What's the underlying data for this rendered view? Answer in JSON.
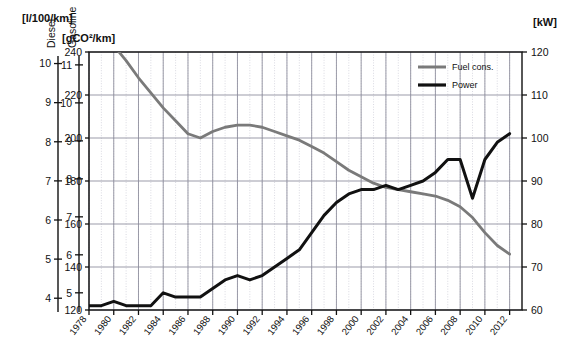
{
  "axes": {
    "top_left_unit": "[l/100/km]",
    "diesel_label": "Diesel",
    "gasoline_label": "Gasoline",
    "co2_unit": "[gCO²/km]",
    "kw_unit": "[kW]",
    "diesel_ticks": [
      "10",
      "9",
      "8",
      "7",
      "6",
      "5",
      "4"
    ],
    "gasoline_ticks": [
      "11",
      "10",
      "9",
      "8",
      "7",
      "6",
      "5"
    ],
    "co2_ticks": [
      "240",
      "220",
      "200",
      "180",
      "160",
      "140",
      "120"
    ],
    "kw_ticks": [
      "120",
      "110",
      "100",
      "90",
      "80",
      "70",
      "60"
    ],
    "x_ticks": [
      "1978",
      "1980",
      "1982",
      "1984",
      "1986",
      "1988",
      "1990",
      "1992",
      "1994",
      "1996",
      "1998",
      "2000",
      "2002",
      "2004",
      "2006",
      "2008",
      "2010",
      "2012"
    ]
  },
  "legend": {
    "items": [
      {
        "label": "Fuel cons.",
        "color": "#7a7a7a"
      },
      {
        "label": "Power",
        "color": "#111111"
      }
    ]
  },
  "colors": {
    "fuel": "#7a7a7a",
    "power": "#111111",
    "grid_major": "#8a8a99",
    "grid_minor": "#c9c9d4",
    "axis": "#111111"
  },
  "chart_data": {
    "type": "line",
    "title": "",
    "subtitle": "",
    "xlabel": "",
    "ylabel": "[gCO²/km]",
    "y2label": "[kW]",
    "grid": true,
    "legend_position": "top-right",
    "xlim": [
      1978,
      2013
    ],
    "ylim": [
      120,
      240
    ],
    "y2lim": [
      60,
      120
    ],
    "extra_axes": [
      {
        "name": "Diesel",
        "unit": "[l/100/km]",
        "range": [
          4,
          10.5
        ],
        "ticks": [
          10,
          9,
          8,
          7,
          6,
          5,
          4
        ]
      },
      {
        "name": "Gasoline",
        "unit": "[l/100/km]",
        "range": [
          4.6,
          11.5
        ],
        "ticks": [
          11,
          10,
          9,
          8,
          7,
          6,
          5
        ]
      }
    ],
    "x": [
      1978,
      1979,
      1980,
      1981,
      1982,
      1983,
      1984,
      1985,
      1986,
      1987,
      1988,
      1989,
      1990,
      1991,
      1992,
      1993,
      1994,
      1995,
      1996,
      1997,
      1998,
      1999,
      2000,
      2001,
      2002,
      2003,
      2004,
      2005,
      2006,
      2007,
      2008,
      2009,
      2010,
      2011,
      2012
    ],
    "series": [
      {
        "name": "Fuel cons.",
        "unit": "gCO²/km",
        "axis": "left",
        "color": "#7a7a7a",
        "values": [
          252,
          248,
          243,
          236,
          228,
          221,
          214,
          208,
          202,
          200,
          203,
          205,
          206,
          206,
          205,
          203,
          201,
          199,
          196,
          193,
          189,
          185,
          182,
          179,
          177,
          176,
          175,
          174,
          173,
          171,
          168,
          163,
          156,
          150,
          146
        ]
      },
      {
        "name": "Power",
        "unit": "kW",
        "axis": "right",
        "color": "#111111",
        "values": [
          61,
          61,
          62,
          61,
          61,
          61,
          64,
          63,
          63,
          63,
          65,
          67,
          68,
          67,
          68,
          70,
          72,
          74,
          78,
          82,
          85,
          87,
          88,
          88,
          89,
          88,
          89,
          90,
          92,
          95,
          95,
          86,
          95,
          99,
          101
        ]
      }
    ]
  }
}
